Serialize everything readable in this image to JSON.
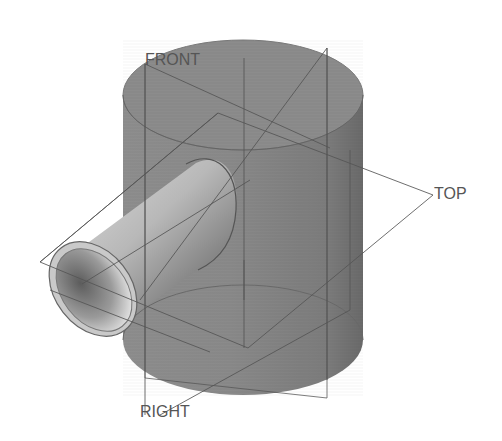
{
  "view": {
    "type": "3D CAD model — isometric shaded view with datum planes",
    "colors": {
      "background": "#ffffff",
      "body_fill": "#8a8a8a",
      "body_dark": "#6f6f6f",
      "body_light": "#9c9c9c",
      "pipe_light": "#d8d8d8",
      "pipe_mid": "#a9a9a9",
      "pipe_dark": "#5e5e5e",
      "datum_line": "#555555",
      "label": "#555555"
    }
  },
  "datum_planes": {
    "front": {
      "label": "FRONT"
    },
    "top": {
      "label": "TOP"
    },
    "right": {
      "label": "RIGHT"
    }
  },
  "model": {
    "features": [
      {
        "name": "main-cylinder",
        "description": "Large vertical solid cylinder"
      },
      {
        "name": "branch-pipe",
        "description": "Hollow tube protruding toward lower-left, intersecting the cylinder"
      }
    ]
  }
}
